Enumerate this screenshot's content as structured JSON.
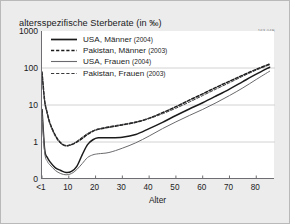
{
  "chart_data": {
    "type": "line",
    "title": "altersspezifische Sterberate (in ‰)",
    "source_code": "163 04E",
    "xlabel": "Alter",
    "ylabel": "",
    "yscale": "log",
    "grid": true,
    "legend_position": "top-left-inside",
    "y_ticks": [
      "1000",
      "100",
      "10",
      "1",
      "0"
    ],
    "y_tick_values": [
      1000,
      100,
      10,
      1,
      0.1
    ],
    "x_ticks": [
      "<1",
      "10",
      "20",
      "30",
      "40",
      "50",
      "60",
      "70",
      "80"
    ],
    "x_tick_values": [
      0,
      10,
      20,
      30,
      40,
      50,
      60,
      70,
      80
    ],
    "xlim": [
      0,
      87
    ],
    "ylim": [
      0.1,
      1000
    ],
    "series": [
      {
        "name": "USA, Männer",
        "year": "2004",
        "style": "solid",
        "width": "thick",
        "color": "#1b1b1b",
        "x": [
          0,
          1,
          2,
          3,
          5,
          7,
          9,
          11,
          13,
          15,
          17,
          19,
          21,
          25,
          30,
          35,
          40,
          45,
          50,
          55,
          60,
          65,
          70,
          75,
          80,
          85
        ],
        "y": [
          7.6,
          0.62,
          0.38,
          0.29,
          0.2,
          0.17,
          0.15,
          0.16,
          0.22,
          0.45,
          0.85,
          1.15,
          1.3,
          1.3,
          1.35,
          1.6,
          2.3,
          3.4,
          5.2,
          7.8,
          11.5,
          17.5,
          27.0,
          43.0,
          68.0,
          105.0
        ]
      },
      {
        "name": "Pakistan, Männer",
        "year": "2003",
        "style": "dashed",
        "width": "thick",
        "color": "#1b1b1b",
        "x": [
          0,
          1,
          2,
          3,
          5,
          7,
          9,
          11,
          13,
          15,
          17,
          19,
          21,
          25,
          30,
          35,
          40,
          45,
          50,
          55,
          60,
          65,
          70,
          75,
          80,
          85
        ],
        "y": [
          78.0,
          13.0,
          6.0,
          3.2,
          1.5,
          0.95,
          0.8,
          0.85,
          1.0,
          1.25,
          1.6,
          1.95,
          2.2,
          2.5,
          2.9,
          3.4,
          4.4,
          6.2,
          9.0,
          13.5,
          20.0,
          30.0,
          44.0,
          64.0,
          92.0,
          128.0
        ]
      },
      {
        "name": "USA, Frauen",
        "year": "2004",
        "style": "solid",
        "width": "thin",
        "color": "#6a6a6e",
        "x": [
          0,
          1,
          2,
          3,
          5,
          7,
          9,
          11,
          13,
          15,
          17,
          19,
          21,
          25,
          30,
          35,
          40,
          45,
          50,
          55,
          60,
          65,
          70,
          75,
          80,
          85
        ],
        "y": [
          6.2,
          0.52,
          0.3,
          0.24,
          0.17,
          0.14,
          0.13,
          0.14,
          0.18,
          0.26,
          0.38,
          0.45,
          0.48,
          0.52,
          0.68,
          0.95,
          1.45,
          2.3,
          3.5,
          5.2,
          7.6,
          11.5,
          18.0,
          29.0,
          49.0,
          82.0
        ]
      },
      {
        "name": "Pakistan, Frauen",
        "year": "2003",
        "style": "dashed",
        "width": "thin",
        "color": "#3a3a3e",
        "x": [
          0,
          1,
          2,
          3,
          5,
          7,
          9,
          11,
          13,
          15,
          17,
          19,
          21,
          25,
          30,
          35,
          40,
          45,
          50,
          55,
          60,
          65,
          70,
          75,
          80,
          85
        ],
        "y": [
          72.0,
          12.0,
          5.5,
          3.0,
          1.4,
          0.9,
          0.78,
          0.85,
          1.05,
          1.35,
          1.7,
          2.0,
          2.25,
          2.6,
          3.0,
          3.5,
          4.3,
          5.8,
          8.2,
          12.0,
          18.0,
          27.0,
          40.0,
          60.0,
          88.0,
          122.0
        ]
      }
    ]
  },
  "legend": [
    {
      "label": "USA, Männer",
      "year": "(2004)"
    },
    {
      "label": "Pakistan, Männer",
      "year": "(2003)"
    },
    {
      "label": "USA, Frauen",
      "year": "(2004)"
    },
    {
      "label": "Pakistan, Frauen",
      "year": "(2003)"
    }
  ]
}
